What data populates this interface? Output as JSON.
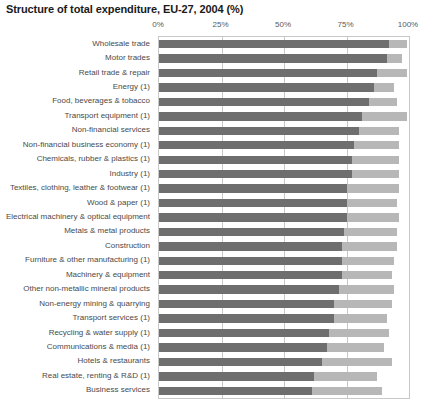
{
  "chart_data": {
    "type": "bar",
    "orientation": "horizontal",
    "stacked": true,
    "title": "Structure of total expenditure, EU-27, 2004 (%)",
    "xlabel": "",
    "ylabel": "",
    "xlim": [
      0,
      100
    ],
    "xticks": [
      "0%",
      "25%",
      "50%",
      "75%",
      "100%"
    ],
    "xtick_values": [
      0,
      25,
      50,
      75,
      100
    ],
    "grid": true,
    "legend": "none",
    "colors": {
      "series_1": "#6e6e6e",
      "series_2": "#b7b7b7",
      "gridline": "#c8c8c8",
      "axis_text": "#595959",
      "label_text": "#4a4a4a",
      "title_text": "#1a1a1a",
      "background": "#ffffff"
    },
    "categories": [
      "Wholesale trade",
      "Motor trades",
      "Retail trade & repair",
      "Energy (1)",
      "Food, beverages & tobacco",
      "Transport equipment (1)",
      "Non-financial services",
      "Non-financial business economy (1)",
      "Chemicals, rubber & plastics (1)",
      "Industry (1)",
      "Textiles, clothing, leather & footwear (1)",
      "Wood & paper (1)",
      "Electrical machinery & optical equipment",
      "Metals & metal products",
      "Construction",
      "Furniture & other manufacturing (1)",
      "Machinery & equipment",
      "Other non-metallic mineral products",
      "Non-energy mining & quarrying",
      "Transport services (1)",
      "Recycling & water supply (1)",
      "Communications & media (1)",
      "Hotels & restaurants",
      "Real estate, renting & R&D (1)",
      "Business services"
    ],
    "series": [
      {
        "name": "Purchases of goods and services",
        "color": "#6e6e6e",
        "values": [
          92,
          91,
          87,
          86,
          84,
          81,
          80,
          78,
          77,
          77,
          75,
          75,
          75,
          74,
          73,
          73,
          73,
          72,
          70,
          70,
          68,
          67,
          65,
          62,
          61
        ]
      },
      {
        "name": "Personnel costs",
        "color": "#b7b7b7",
        "values": [
          7,
          6,
          12,
          8,
          11,
          18,
          16,
          18,
          19,
          19,
          21,
          20,
          21,
          21,
          22,
          21,
          20,
          22,
          23,
          21,
          24,
          23,
          28,
          25,
          28
        ]
      }
    ]
  }
}
